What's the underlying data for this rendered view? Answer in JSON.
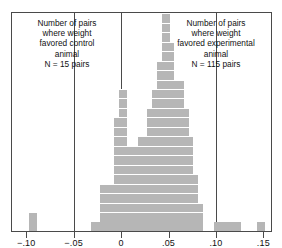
{
  "chart_data": {
    "type": "bar",
    "title": "",
    "subtitle": "",
    "xlabel": "",
    "ylabel": "",
    "xlim": [
      -0.115,
      0.158
    ],
    "ylim": [
      0,
      23
    ],
    "grid": false,
    "legend_position": "none",
    "bin_width": 0.005,
    "block_unit": 1,
    "tick_values": [
      -0.1,
      -0.05,
      0,
      0.05,
      0.1,
      0.15
    ],
    "tick_labels": [
      "−.10",
      "−.05",
      "0",
      ".05",
      ".10",
      ".15"
    ],
    "reference_lines": [
      -0.05,
      0,
      0.05,
      0.1
    ],
    "bar_color": "#b6b6b6",
    "frame_color": "#4a4a4a",
    "x": [
      -0.0925,
      -0.0275,
      -0.0225,
      -0.0175,
      -0.0125,
      -0.0075,
      -0.0025,
      0.0025,
      0.0075,
      0.0125,
      0.0175,
      0.0225,
      0.0275,
      0.0325,
      0.0375,
      0.0425,
      0.0475,
      0.0525,
      0.0575,
      0.0625,
      0.0675,
      0.0725,
      0.0775,
      0.0825,
      0.1025,
      0.1075,
      0.1125,
      0.1175,
      0.1225,
      0.1475
    ],
    "values": [
      2,
      1,
      1,
      5,
      5,
      5,
      12,
      15,
      9,
      9,
      9,
      10,
      10,
      13,
      15,
      18,
      23,
      20,
      16,
      16,
      13,
      10,
      6,
      3,
      1,
      1,
      1,
      1,
      1,
      1
    ],
    "annotations": [
      {
        "name": "control-annotation",
        "position": "left",
        "lines": [
          "Number of pairs",
          "where weight",
          "favored control",
          "animal",
          "N = 15 pairs"
        ],
        "count_label": "N = 15 pairs",
        "count": 15
      },
      {
        "name": "experimental-annotation",
        "position": "right",
        "lines": [
          "Number of pairs",
          "where weight",
          "favored experimental",
          "animal",
          "N = 115 pairs"
        ],
        "count_label": "N = 115 pairs",
        "count": 115
      }
    ]
  }
}
